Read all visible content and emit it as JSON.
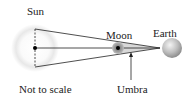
{
  "diagram": {
    "labels": {
      "sun": "Sun",
      "moon": "Moon",
      "earth": "Earth",
      "umbra": "Umbra",
      "note": "Not to scale"
    },
    "colors": {
      "line": "#222222",
      "sun_glow": "#e6e6e6",
      "moon": "#8a8a8a",
      "earth": "#b5b5b5",
      "umbra_fill": "#d0d0d0"
    }
  }
}
